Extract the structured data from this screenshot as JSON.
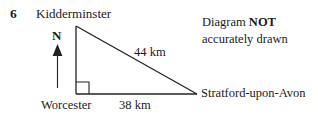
{
  "question": {
    "number": "6"
  },
  "note": {
    "line1_prefix": "Diagram ",
    "line1_emphasis": "NOT",
    "line2": "accurately drawn"
  },
  "compass": {
    "label": "N",
    "icon": "north-arrow-icon"
  },
  "diagram": {
    "type": "right-angled-triangle",
    "right_angle_at": "Worcester",
    "vertices": [
      {
        "name": "Kidderminster",
        "label": "Kidderminster",
        "x": 76,
        "y": 26
      },
      {
        "name": "Worcester",
        "label": "Worcester",
        "x": 76,
        "y": 94
      },
      {
        "name": "Stratford-upon-Avon",
        "label": "Stratford-upon-Avon",
        "x": 197,
        "y": 94
      }
    ],
    "sides": [
      {
        "name": "hypotenuse",
        "from": "Kidderminster",
        "to": "Stratford-upon-Avon",
        "label": "44 km"
      },
      {
        "name": "base",
        "from": "Worcester",
        "to": "Stratford-upon-Avon",
        "label": "38 km"
      },
      {
        "name": "vertical",
        "from": "Kidderminster",
        "to": "Worcester",
        "label": ""
      }
    ],
    "labels": {
      "kidderminster": "Kidderminster",
      "worcester": "Worcester",
      "stratford": "Stratford-upon-Avon",
      "hypotenuse": "44 km",
      "base": "38 km"
    },
    "colors": {
      "stroke": "#222222",
      "background": "#ffffff",
      "text": "#1a1a1a"
    }
  }
}
